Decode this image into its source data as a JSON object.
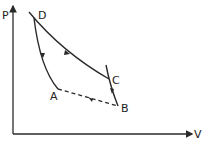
{
  "diagram": {
    "type": "pv-cycle",
    "axes": {
      "y_label": "P",
      "x_label": "V"
    },
    "points": [
      {
        "name": "D",
        "label": "D"
      },
      {
        "name": "C",
        "label": "C"
      },
      {
        "name": "B",
        "label": "B"
      },
      {
        "name": "A",
        "label": "A"
      }
    ],
    "segments": [
      {
        "from": "D",
        "to": "C",
        "style": "solid",
        "direction": "D→C"
      },
      {
        "from": "C",
        "to": "B",
        "style": "solid",
        "direction": "C→B"
      },
      {
        "from": "B",
        "to": "A",
        "style": "dashed",
        "direction": "B→A"
      },
      {
        "from": "D",
        "to": "A",
        "style": "solid",
        "direction": "D→A"
      }
    ],
    "colors": {
      "line": "#2a2a2a",
      "background": "#ffffff"
    }
  }
}
